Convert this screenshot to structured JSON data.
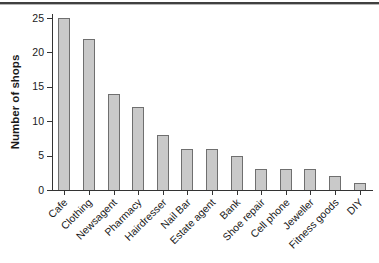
{
  "figure": {
    "top_rule_color": "#404040"
  },
  "chart_data": {
    "type": "bar",
    "title": "",
    "xlabel": "",
    "ylabel": "Number of shops",
    "categories": [
      "Cafe",
      "Clothing",
      "Newsagent",
      "Pharmacy",
      "Hairdresser",
      "Nail Bar",
      "Estate agent",
      "Bank",
      "Shoe repair",
      "Cell phone",
      "Jeweller",
      "Fitness goods",
      "DIY"
    ],
    "values": [
      25,
      22,
      14,
      12,
      8,
      6,
      6,
      5,
      3,
      3,
      3,
      2,
      1
    ],
    "yticks": [
      0,
      5,
      10,
      15,
      20,
      25
    ],
    "ylim": [
      0,
      26
    ],
    "grid": false,
    "legend": "none",
    "x_label_rotation_deg": 45,
    "bar_fill": "#c9c9c9",
    "bar_border": "#6f6f6f",
    "axis_color": "#333333",
    "text_color": "#1a1a1a"
  }
}
